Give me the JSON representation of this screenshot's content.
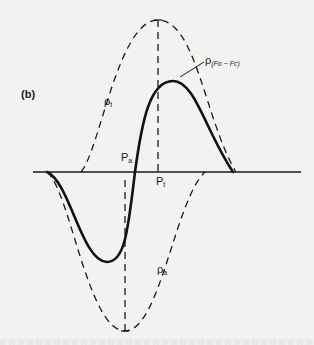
{
  "figure": {
    "panel_label": "(b)",
    "curves": {
      "rho_t": {
        "label": "ρ",
        "sub": "t",
        "style": "dashed"
      },
      "rho_a": {
        "label": "ρ",
        "sub": "a",
        "style": "dashed"
      },
      "rho_diff": {
        "label": "ρ",
        "sub": "(Fo − Fc)",
        "style": "solid"
      }
    },
    "markers": {
      "Pa": {
        "label": "P",
        "sub": "a"
      },
      "Pt": {
        "label": "P",
        "sub": "t"
      }
    },
    "colors": {
      "ink": "#1a1a1a",
      "paper": "#f2f2f0"
    }
  }
}
